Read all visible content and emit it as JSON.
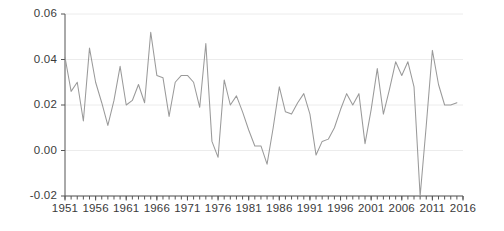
{
  "chart_data": {
    "type": "line",
    "title": "",
    "subtitle": "",
    "xlabel": "",
    "ylabel": "",
    "xlim": [
      1951,
      2016
    ],
    "ylim": [
      -0.02,
      0.06
    ],
    "grid": true,
    "grid_axis": "y",
    "legend": false,
    "legend_position": "none",
    "line_color": "#9a9a9a",
    "axis_color": "#555555",
    "grid_color": "#ececec",
    "tick_label_color": "#3a3a3a",
    "y_ticks": [
      -0.02,
      0.0,
      0.02,
      0.04,
      0.06
    ],
    "y_tick_labels": [
      "-0.02",
      "0.00",
      "0.02",
      "0.04",
      "0.06"
    ],
    "x_ticks": [
      1951,
      1956,
      1961,
      1966,
      1971,
      1976,
      1981,
      1986,
      1991,
      1996,
      2001,
      2006,
      2011,
      2016
    ],
    "x_tick_labels": [
      "1951",
      "1956",
      "1961",
      "1966",
      "1971",
      "1976",
      "1981",
      "1986",
      "1991",
      "1996",
      "2001",
      "2006",
      "2011",
      "2016"
    ],
    "x_minor_tick_step": 1,
    "x": [
      1951,
      1952,
      1953,
      1954,
      1955,
      1956,
      1957,
      1958,
      1959,
      1960,
      1961,
      1962,
      1963,
      1964,
      1965,
      1966,
      1967,
      1968,
      1969,
      1970,
      1971,
      1972,
      1973,
      1974,
      1975,
      1976,
      1977,
      1978,
      1979,
      1980,
      1981,
      1982,
      1983,
      1984,
      1985,
      1986,
      1987,
      1988,
      1989,
      1990,
      1991,
      1992,
      1993,
      1994,
      1995,
      1996,
      1997,
      1998,
      1999,
      2000,
      2001,
      2002,
      2003,
      2004,
      2005,
      2006,
      2007,
      2008,
      2009,
      2010,
      2011,
      2012,
      2013,
      2014,
      2015
    ],
    "y": [
      0.041,
      0.026,
      0.03,
      0.013,
      0.045,
      0.03,
      0.021,
      0.011,
      0.022,
      0.037,
      0.02,
      0.022,
      0.029,
      0.021,
      0.052,
      0.033,
      0.032,
      0.015,
      0.03,
      0.033,
      0.033,
      0.03,
      0.019,
      0.047,
      0.004,
      -0.003,
      0.031,
      0.02,
      0.024,
      0.017,
      0.009,
      0.002,
      0.002,
      -0.006,
      0.01,
      0.028,
      0.017,
      0.016,
      0.021,
      0.025,
      0.016,
      -0.002,
      0.004,
      0.005,
      0.01,
      0.018,
      0.025,
      0.02,
      0.025,
      0.003,
      0.018,
      0.036,
      0.016,
      0.027,
      0.039,
      0.033,
      0.039,
      0.028,
      -0.02,
      0.011,
      0.044,
      0.029,
      0.02,
      0.02,
      0.021
    ],
    "series": [
      {
        "name": "series-1",
        "values": [
          0.041,
          0.026,
          0.03,
          0.013,
          0.045,
          0.03,
          0.021,
          0.011,
          0.022,
          0.037,
          0.02,
          0.022,
          0.029,
          0.021,
          0.052,
          0.033,
          0.032,
          0.015,
          0.03,
          0.033,
          0.033,
          0.03,
          0.019,
          0.047,
          0.004,
          -0.003,
          0.031,
          0.02,
          0.024,
          0.017,
          0.009,
          0.002,
          0.002,
          -0.006,
          0.01,
          0.028,
          0.017,
          0.016,
          0.021,
          0.025,
          0.016,
          -0.002,
          0.004,
          0.005,
          0.01,
          0.018,
          0.025,
          0.02,
          0.025,
          0.003,
          0.018,
          0.036,
          0.016,
          0.027,
          0.039,
          0.033,
          0.039,
          0.028,
          -0.02,
          0.011,
          0.044,
          0.029,
          0.02,
          0.02,
          0.021
        ]
      }
    ]
  }
}
